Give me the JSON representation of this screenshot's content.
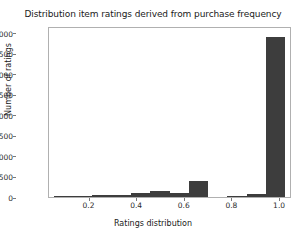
{
  "chart_data": {
    "type": "bar",
    "title": "Distribution item ratings derived from purchase frequency",
    "xlabel": "Ratings distribution",
    "ylabel": "Number of ratings",
    "xlim": [
      0.03,
      1.05
    ],
    "ylim": [
      0,
      20800
    ],
    "grid": false,
    "legend": null,
    "bar_color": "#3d3d3d",
    "background_color": "#ffffff",
    "axis_color": "#b0b0b0",
    "bin_width": 0.081,
    "xticks": [
      "0.2",
      "0.4",
      "0.6",
      "0.8",
      "1.0"
    ],
    "xtick_values": [
      0.2,
      0.4,
      0.6,
      0.8,
      1.0
    ],
    "yticks": [
      "0",
      "2500",
      "5000",
      "7500",
      "10000",
      "12500",
      "15000",
      "17500",
      "20000"
    ],
    "ytick_values": [
      0,
      2500,
      5000,
      7500,
      10000,
      12500,
      15000,
      17500,
      20000
    ],
    "bins": [
      {
        "x0": 0.05,
        "x1": 0.131,
        "center": 0.09,
        "value": 30
      },
      {
        "x0": 0.131,
        "x1": 0.212,
        "center": 0.172,
        "value": 170
      },
      {
        "x0": 0.212,
        "x1": 0.293,
        "center": 0.253,
        "value": 230
      },
      {
        "x0": 0.293,
        "x1": 0.374,
        "center": 0.334,
        "value": 250
      },
      {
        "x0": 0.374,
        "x1": 0.455,
        "center": 0.415,
        "value": 480
      },
      {
        "x0": 0.455,
        "x1": 0.536,
        "center": 0.496,
        "value": 740
      },
      {
        "x0": 0.536,
        "x1": 0.617,
        "center": 0.577,
        "value": 510
      },
      {
        "x0": 0.617,
        "x1": 0.698,
        "center": 0.658,
        "value": 1900
      },
      {
        "x0": 0.698,
        "x1": 0.779,
        "center": 0.739,
        "value": 0
      },
      {
        "x0": 0.779,
        "x1": 0.86,
        "center": 0.82,
        "value": 40
      },
      {
        "x0": 0.86,
        "x1": 0.941,
        "center": 0.901,
        "value": 330
      },
      {
        "x0": 0.941,
        "x1": 1.022,
        "center": 0.982,
        "value": 19500
      }
    ]
  }
}
